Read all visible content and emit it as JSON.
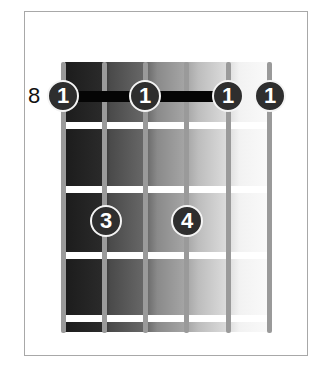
{
  "diagram": {
    "type": "guitar-chord-chart",
    "fret_label": "8",
    "strings": 6,
    "frets_shown": 4,
    "barre": {
      "fret": 1,
      "from_string": 1,
      "to_string": 5
    },
    "dots": [
      {
        "string": 1,
        "fret": 1,
        "finger": "1"
      },
      {
        "string": 3,
        "fret": 1,
        "finger": "1"
      },
      {
        "string": 5,
        "fret": 1,
        "finger": "1"
      },
      {
        "string": 6,
        "fret": 1,
        "finger": "1"
      },
      {
        "string": 2,
        "fret": 3,
        "finger": "3"
      },
      {
        "string": 4,
        "fret": 3,
        "finger": "4"
      }
    ],
    "colors": {
      "dot_fill": "#2e2e2e",
      "dot_outline": "#f4f4f4",
      "barre": "#050505",
      "string": "#9a9a9a",
      "fret": "#ffffff",
      "gradient_dark": "#1c1c1c",
      "gradient_light": "#fafafa"
    }
  }
}
